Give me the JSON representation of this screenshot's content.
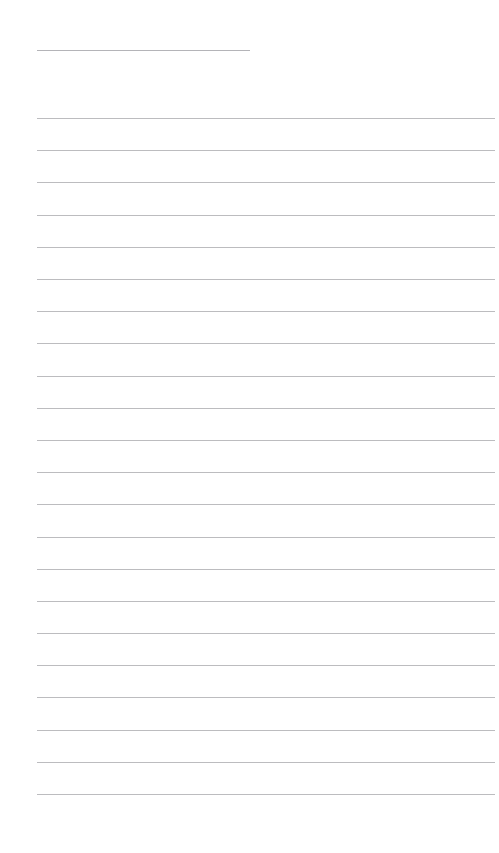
{
  "document": {
    "kind": "lined-paper",
    "page_number": 1,
    "background_color": "#ffffff",
    "rule_color": "#bcbcbf",
    "title_rule_color": "#b4b4b8",
    "page_width": 499,
    "page_height": 853,
    "left_margin": 37,
    "right_margin": 4,
    "title": "",
    "body_text": ""
  },
  "title_rule": {
    "name": "title-rule",
    "x": 37,
    "y": 50,
    "width": 213,
    "thickness": 1,
    "color": "#b4b4b8",
    "label": ""
  },
  "body_rules": {
    "count": 22,
    "first_y": 118,
    "spacing": 32.2,
    "x": 37,
    "width": 458,
    "thickness": 1,
    "color": "#bcbcbf",
    "lines": [
      {
        "index": 1,
        "y": 118,
        "text": ""
      },
      {
        "index": 2,
        "y": 150,
        "text": ""
      },
      {
        "index": 3,
        "y": 182,
        "text": ""
      },
      {
        "index": 4,
        "y": 215,
        "text": ""
      },
      {
        "index": 5,
        "y": 247,
        "text": ""
      },
      {
        "index": 6,
        "y": 279,
        "text": ""
      },
      {
        "index": 7,
        "y": 311,
        "text": ""
      },
      {
        "index": 8,
        "y": 343,
        "text": ""
      },
      {
        "index": 9,
        "y": 376,
        "text": ""
      },
      {
        "index": 10,
        "y": 408,
        "text": ""
      },
      {
        "index": 11,
        "y": 440,
        "text": ""
      },
      {
        "index": 12,
        "y": 472,
        "text": ""
      },
      {
        "index": 13,
        "y": 504,
        "text": ""
      },
      {
        "index": 14,
        "y": 537,
        "text": ""
      },
      {
        "index": 15,
        "y": 569,
        "text": ""
      },
      {
        "index": 16,
        "y": 601,
        "text": ""
      },
      {
        "index": 17,
        "y": 633,
        "text": ""
      },
      {
        "index": 18,
        "y": 665,
        "text": ""
      },
      {
        "index": 19,
        "y": 697,
        "text": ""
      },
      {
        "index": 20,
        "y": 730,
        "text": ""
      },
      {
        "index": 21,
        "y": 762,
        "text": ""
      },
      {
        "index": 22,
        "y": 794,
        "text": ""
      }
    ]
  }
}
